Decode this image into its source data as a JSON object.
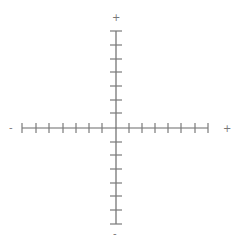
{
  "diagram": {
    "type": "axes-cross",
    "center": {
      "x": 116,
      "y": 128
    },
    "axis_color": "#6a6a6a",
    "tick_color": "#7a7a7a",
    "horizontal_axis": {
      "from_x": 22,
      "to_x": 208,
      "y": 128,
      "ticks_x": [
        22,
        36,
        49,
        63,
        76,
        89,
        102,
        129,
        142,
        155,
        168,
        181,
        195,
        208
      ],
      "tick_half_height": 5,
      "negative_label": "-",
      "positive_label": "+"
    },
    "vertical_axis": {
      "from_y": 31,
      "to_y": 224,
      "x": 116,
      "ticks_y": [
        31,
        45,
        59,
        72,
        86,
        100,
        113,
        142,
        155,
        169,
        183,
        196,
        210,
        224
      ],
      "tick_half_width": 6,
      "positive_label": "+",
      "negative_label": "-"
    }
  }
}
